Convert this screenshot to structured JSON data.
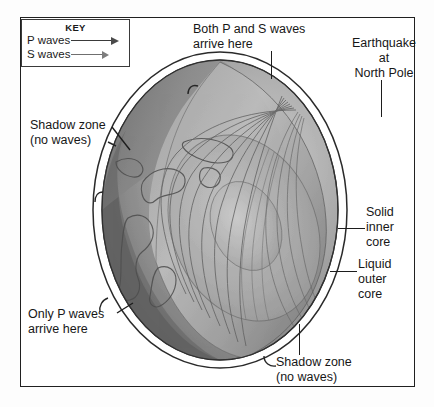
{
  "figure": {
    "type": "cutaway-earth-diagram"
  },
  "key": {
    "title": "KEY",
    "entries": [
      {
        "label": "P waves",
        "arrow": "long-dark-arrow",
        "color": "#4a4a4a"
      },
      {
        "label": "S waves",
        "arrow": "short-gray-arrow",
        "color": "#7d7d7d"
      }
    ]
  },
  "labels": {
    "both_waves": {
      "line1": "Both P and S waves",
      "line2": "arrive here"
    },
    "earthquake": {
      "line1": "Earthquake",
      "line2": "at",
      "line3": "North Pole"
    },
    "shadow_zone_left": {
      "line1": "Shadow zone",
      "line2": "(no waves)"
    },
    "only_p_waves": {
      "line1": "Only P waves",
      "line2": "arrive here"
    },
    "solid_inner_core": {
      "line1": "Solid",
      "line2": "inner",
      "line3": "core"
    },
    "liquid_outer_core": {
      "line1": "Liquid",
      "line2": "outer",
      "line3": "core"
    },
    "shadow_zone_bottom": {
      "line1": "Shadow zone",
      "line2": "(no waves)"
    }
  },
  "colors": {
    "frame": "#202020",
    "background": "#ffffff",
    "text": "#171717",
    "globe_light": "#b9b9b9",
    "globe_mid": "#9a9a9a",
    "globe_dark": "#6f6f6f",
    "globe_darkest": "#555555",
    "rim_highlight": "#ffffff",
    "ray_line": "#5e5e5e"
  }
}
